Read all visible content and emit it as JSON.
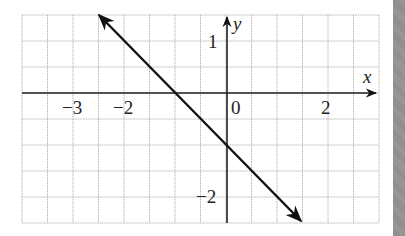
{
  "chart_data": {
    "type": "line",
    "title": "",
    "xlabel": "x",
    "ylabel": "y",
    "xlim": [
      -4,
      3
    ],
    "ylim": [
      -2.5,
      1.5
    ],
    "grid": true,
    "grid_step": 0.5,
    "x_tick_labels": [
      "−3",
      "−2",
      "0",
      "2"
    ],
    "x_tick_values": [
      -3,
      -2,
      0,
      2
    ],
    "y_tick_labels": [
      "1",
      "−2"
    ],
    "y_tick_values": [
      1,
      -2
    ],
    "series": [
      {
        "name": "y = -x - 1",
        "slope": -1,
        "intercept": -1,
        "x": [
          -2.5,
          -1,
          0,
          1.5
        ],
        "y": [
          1.5,
          0,
          -1,
          -2.5
        ],
        "arrows_both_ends": true
      }
    ],
    "colors": {
      "line": "#111111",
      "grid": "#b0b0b0",
      "axis": "#222222",
      "side_strip": "#8e8e8e"
    }
  },
  "labels": {
    "x_axis": "x",
    "y_axis": "y",
    "x_ticks": [
      "−3",
      "−2",
      "0",
      "2"
    ],
    "y_ticks": [
      "1",
      "−2"
    ]
  }
}
